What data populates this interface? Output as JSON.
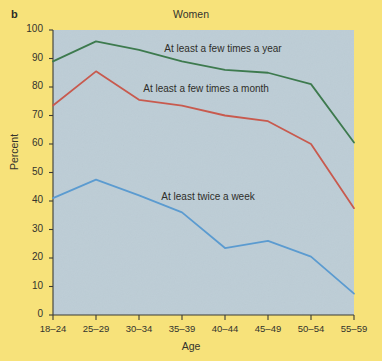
{
  "figure": {
    "panel_letter": "b",
    "title": "Women",
    "background_color": "#f7e27a",
    "plot_background_color": "#bdcdd6"
  },
  "chart_data": {
    "type": "line",
    "title": "Women",
    "xlabel": "Age",
    "ylabel": "Percent",
    "categories": [
      "18–24",
      "25–29",
      "30–34",
      "35–39",
      "40–44",
      "45–49",
      "50–54",
      "55–59"
    ],
    "ylim": [
      0,
      100
    ],
    "ytick_values": [
      0,
      10,
      20,
      30,
      40,
      50,
      60,
      70,
      80,
      90,
      100
    ],
    "grid": false,
    "legend_position": "inline-annotation",
    "series": [
      {
        "name": "At least a few times a year",
        "color": "#3d7a4e",
        "values": [
          89,
          96,
          93,
          89,
          86,
          85,
          81,
          60.5
        ],
        "label_x_pct": 37,
        "label_y_pct": 93
      },
      {
        "name": "At least a few times a month",
        "color": "#c85a4e",
        "values": [
          73.5,
          85.5,
          75.5,
          73.5,
          70,
          68,
          60,
          37.5
        ],
        "label_x_pct": 30,
        "label_y_pct": 79
      },
      {
        "name": "At least twice a week",
        "color": "#5b9bd0",
        "values": [
          41,
          47.5,
          42,
          36,
          23.5,
          26,
          20.5,
          7.5
        ],
        "label_x_pct": 36,
        "label_y_pct": 41
      }
    ]
  }
}
